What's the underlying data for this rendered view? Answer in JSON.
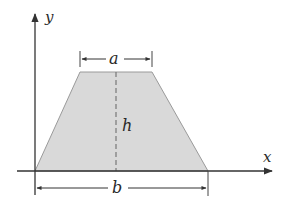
{
  "diagram": {
    "type": "trapezoid-area-figure",
    "colors": {
      "fill": "#d9d9d9",
      "stroke": "#8a8a8a",
      "axis": "#333333",
      "text": "#2a2a2a",
      "background": "#ffffff"
    },
    "axes": {
      "x_label": "x",
      "y_label": "y"
    },
    "shape": {
      "name": "trapezoid",
      "vertices": [
        [
          35,
          171
        ],
        [
          80,
          72
        ],
        [
          152,
          72
        ],
        [
          208,
          171
        ]
      ]
    },
    "dimensions": {
      "top_base_label": "a",
      "bottom_base_label": "b",
      "height_label": "h"
    }
  }
}
